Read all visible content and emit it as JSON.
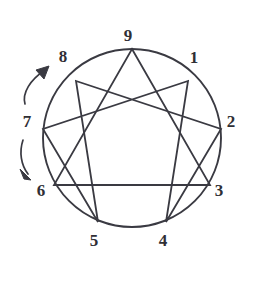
{
  "figure": {
    "name": "enneagram-diagram",
    "background_color": "#ffffff",
    "stroke_color": "#3a3a42",
    "label_color": "#2f2f35"
  },
  "circle": {
    "center_x": 132,
    "center_y": 138,
    "radius": 89,
    "stroke_width": 1.9
  },
  "points": [
    {
      "id": "point-1",
      "label": "1",
      "angle_deg": 40,
      "vx": 188,
      "vy": 81,
      "lx": 194,
      "ly": 58
    },
    {
      "id": "point-2",
      "label": "2",
      "angle_deg": 0,
      "vx": 221,
      "vy": 129,
      "lx": 231,
      "ly": 122
    },
    {
      "id": "point-3",
      "label": "3",
      "angle_deg": -40,
      "vx": 210,
      "vy": 185,
      "lx": 219,
      "ly": 191
    },
    {
      "id": "point-4",
      "label": "4",
      "angle_deg": -80,
      "vx": 166,
      "vy": 222,
      "lx": 163,
      "ly": 241
    },
    {
      "id": "point-5",
      "label": "5",
      "angle_deg": -120,
      "vx": 98,
      "vy": 222,
      "lx": 94,
      "ly": 241
    },
    {
      "id": "point-6",
      "label": "6",
      "angle_deg": -160,
      "vx": 54,
      "vy": 185,
      "lx": 41,
      "ly": 191
    },
    {
      "id": "point-7",
      "label": "7",
      "angle_deg": 180,
      "vx": 43,
      "vy": 129,
      "lx": 27,
      "ly": 122
    },
    {
      "id": "point-8",
      "label": "8",
      "angle_deg": 140,
      "vx": 76,
      "vy": 81,
      "lx": 63,
      "ly": 57
    },
    {
      "id": "point-9",
      "label": "9",
      "angle_deg": 90,
      "vx": 132,
      "vy": 49,
      "lx": 128,
      "ly": 36
    }
  ],
  "triangle": {
    "name": "inner-triangle",
    "sequence": [
      "9",
      "3",
      "6"
    ],
    "path": "M 132 49 L 210 185 L 54 185 Z"
  },
  "hexad": {
    "name": "hexad-path",
    "sequence": [
      "1",
      "4",
      "2",
      "8",
      "5",
      "7"
    ],
    "path": "M 188 81 L 166 222 L 221 129 L 76 81 L 98 222 L 43 129 Z"
  },
  "arrows": [
    {
      "id": "arrow-up-left",
      "name": "arrow-toward-eight",
      "direction": "up",
      "path": "M 25 104 C 22 93 30 80 45 70",
      "head": "M 45 70 L 37 72 L 44 78 Z"
    },
    {
      "id": "arrow-down-left",
      "name": "arrow-toward-six",
      "direction": "down",
      "path": "M 23 140 C 19 152 21 165 28 174",
      "head": "M 28 174 L 21 170 L 25 179 Z"
    }
  ]
}
